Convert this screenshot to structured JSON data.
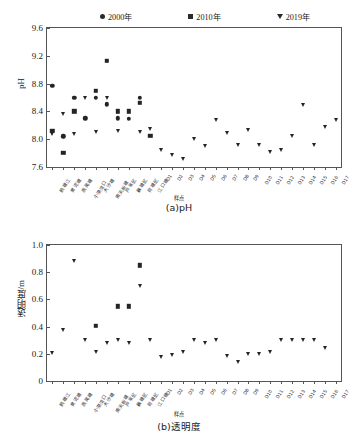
{
  "figure": {
    "legend": [
      {
        "label": "2000年",
        "marker": "circle-icon",
        "color": "#242424"
      },
      {
        "label": "2010年",
        "marker": "square-icon",
        "color": "#242424"
      },
      {
        "label": "2019年",
        "marker": "triangle-down-icon",
        "color": "#242424"
      }
    ],
    "caption_a": "(a)pH",
    "caption_b": "(b)透明度"
  },
  "sites": [
    "鹅塘江",
    "黄泥塘",
    "燕尾塘",
    "小港湾口",
    "大沙塘",
    "南天新塘",
    "芦苇区",
    "藕塘区",
    "荷塘区",
    "江口塘",
    "D1",
    "D2",
    "D3",
    "D4",
    "D5",
    "D6",
    "D7",
    "D8",
    "D9",
    "D10",
    "D11",
    "D12",
    "D13",
    "D14",
    "D15",
    "D16",
    "D17"
  ],
  "chart_data": [
    {
      "type": "scatter",
      "title": "(a)pH",
      "xlabel": "样点",
      "ylabel": "pH",
      "ylim": [
        7.6,
        9.6
      ],
      "yticks": [
        "7.6",
        "8.0",
        "8.4",
        "8.8",
        "9.2",
        "9.6"
      ],
      "ytick_values": [
        7.6,
        8.0,
        8.4,
        8.8,
        9.2,
        9.6
      ],
      "grid": false,
      "legend_position": "top-center",
      "categories": [
        "鹅塘江",
        "黄泥塘",
        "燕尾塘",
        "小港湾口",
        "大沙塘",
        "南天新塘",
        "芦苇区",
        "藕塘区",
        "荷塘区",
        "江口塘",
        "D1",
        "D2",
        "D3",
        "D4",
        "D5",
        "D6",
        "D7",
        "D8",
        "D9",
        "D10",
        "D11",
        "D12",
        "D13",
        "D14",
        "D15",
        "D16",
        "D17"
      ],
      "series": [
        {
          "name": "2000年",
          "marker": "circle",
          "values": [
            8.77,
            8.04,
            8.6,
            8.3,
            8.6,
            8.5,
            8.3,
            8.29,
            8.6,
            null,
            null,
            null,
            null,
            null,
            null,
            null,
            null,
            null,
            null,
            null,
            null,
            null,
            null,
            null,
            null,
            null,
            null
          ]
        },
        {
          "name": "2010年",
          "marker": "square",
          "values": [
            8.12,
            7.8,
            8.4,
            null,
            8.7,
            9.13,
            8.4,
            8.4,
            8.52,
            8.05,
            null,
            null,
            null,
            null,
            null,
            null,
            null,
            null,
            null,
            null,
            null,
            null,
            null,
            null,
            null,
            null,
            null
          ]
        },
        {
          "name": "2019年",
          "marker": "triangle",
          "values": [
            8.08,
            8.36,
            8.07,
            8.6,
            8.11,
            8.6,
            8.12,
            null,
            8.11,
            8.15,
            7.84,
            7.77,
            7.72,
            8.0,
            7.9,
            8.28,
            8.09,
            7.91,
            8.13,
            7.91,
            7.82,
            7.84,
            8.05,
            8.49,
            7.91,
            8.17,
            8.27
          ]
        }
      ]
    },
    {
      "type": "scatter",
      "title": "(b)透明度",
      "xlabel": "样点",
      "ylabel": "透明度/m",
      "ylim": [
        0,
        1.0
      ],
      "yticks": [
        "0",
        "0.2",
        "0.4",
        "0.6",
        "0.8",
        "1.0"
      ],
      "ytick_values": [
        0,
        0.2,
        0.4,
        0.6,
        0.8,
        1.0
      ],
      "grid": false,
      "legend_position": "shared-with-(a)",
      "categories": [
        "鹅塘江",
        "黄泥塘",
        "燕尾塘",
        "小港湾口",
        "大沙塘",
        "南天新塘",
        "芦苇区",
        "藕塘区",
        "荷塘区",
        "江口塘",
        "D1",
        "D2",
        "D3",
        "D4",
        "D5",
        "D6",
        "D7",
        "D8",
        "D9",
        "D10",
        "D11",
        "D12",
        "D13",
        "D14",
        "D15",
        "D16",
        "D17"
      ],
      "series": [
        {
          "name": "2010年",
          "marker": "square",
          "values": [
            null,
            null,
            null,
            null,
            0.405,
            null,
            0.55,
            0.55,
            0.85,
            null,
            null,
            null,
            null,
            null,
            null,
            null,
            null,
            null,
            null,
            null,
            null,
            null,
            null,
            null,
            null,
            null,
            null
          ]
        },
        {
          "name": "2019年",
          "marker": "triangle",
          "values": [
            0.205,
            0.375,
            0.885,
            0.3,
            0.21,
            0.28,
            0.305,
            0.28,
            0.7,
            0.3,
            0.18,
            0.19,
            0.21,
            0.3,
            0.28,
            0.3,
            0.185,
            0.14,
            0.2,
            0.2,
            0.21,
            0.3,
            0.3,
            0.3,
            0.3,
            0.24,
            null
          ]
        }
      ]
    }
  ]
}
